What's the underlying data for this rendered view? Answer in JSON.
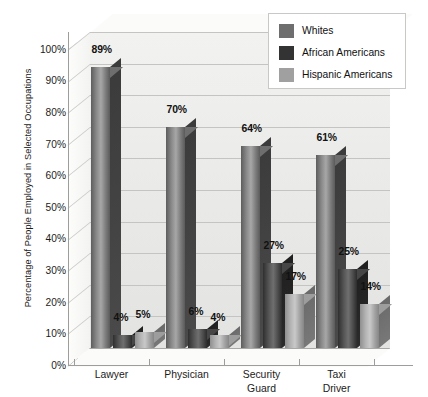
{
  "chart_data": {
    "type": "bar",
    "title": "",
    "xlabel": "",
    "ylabel": "Percentage of People Employed in Selected Occupations",
    "ylim": [
      0,
      100
    ],
    "yticks": [
      "0%",
      "10%",
      "20%",
      "30%",
      "40%",
      "50%",
      "60%",
      "70%",
      "80%",
      "90%",
      "100%"
    ],
    "grid": true,
    "legend_position": "top-right",
    "categories": [
      "Lawyer",
      "Physician",
      "Security Guard",
      "Taxi Driver"
    ],
    "series": [
      {
        "name": "Whites",
        "color": "#6e6e6e",
        "values": [
          89,
          70,
          64,
          61
        ],
        "labels": [
          "89%",
          "70%",
          "64%",
          "61%"
        ]
      },
      {
        "name": "African Americans",
        "color": "#333333",
        "values": [
          4,
          6,
          27,
          25
        ],
        "labels": [
          "4%",
          "6%",
          "27%",
          "25%"
        ]
      },
      {
        "name": "Hispanic Americans",
        "color": "#a0a0a0",
        "values": [
          5,
          4,
          17,
          14
        ],
        "labels": [
          "5%",
          "4%",
          "17%",
          "14%"
        ]
      }
    ]
  },
  "axis": {
    "y_title": "Percentage of People Employed in Selected Occupations",
    "ticks": [
      "100%",
      "90%",
      "80%",
      "70%",
      "60%",
      "50%",
      "40%",
      "30%",
      "20%",
      "10%",
      "0%"
    ]
  },
  "category_labels": [
    {
      "line1": "Lawyer",
      "line2": ""
    },
    {
      "line1": "Physician",
      "line2": ""
    },
    {
      "line1": "Security",
      "line2": "Guard"
    },
    {
      "line1": "Taxi",
      "line2": "Driver"
    }
  ],
  "legend": {
    "items": [
      {
        "label": "Whites",
        "color": "#6e6e6e"
      },
      {
        "label": "African Americans",
        "color": "#333333"
      },
      {
        "label": "Hispanic Americans",
        "color": "#a0a0a0"
      }
    ]
  }
}
